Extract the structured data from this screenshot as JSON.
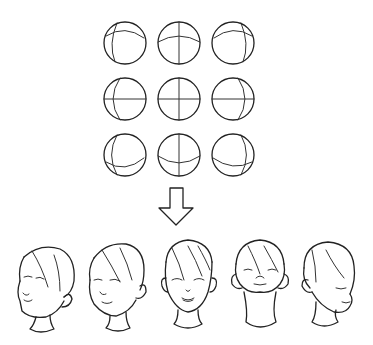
{
  "figure": {
    "description": "Head rotation guide: 3x3 grid of construction spheres mapped to drawn heads",
    "stroke_color": "#222222",
    "background": "#ffffff"
  },
  "spheres": [
    {
      "id": "up-left",
      "cx": 125,
      "cy": 43
    },
    {
      "id": "up",
      "cx": 179,
      "cy": 43
    },
    {
      "id": "up-right",
      "cx": 233,
      "cy": 43
    },
    {
      "id": "left",
      "cx": 125,
      "cy": 99
    },
    {
      "id": "front",
      "cx": 179,
      "cy": 99
    },
    {
      "id": "right",
      "cx": 233,
      "cy": 99
    },
    {
      "id": "down-left",
      "cx": 125,
      "cy": 155
    },
    {
      "id": "down",
      "cx": 179,
      "cy": 155
    },
    {
      "id": "down-right",
      "cx": 233,
      "cy": 155
    }
  ],
  "arrow": {
    "direction": "down",
    "x": 176,
    "y": 200
  },
  "heads": [
    {
      "id": "head-left-tilt",
      "view": "three-quarter left, tilted"
    },
    {
      "id": "head-three-quarter",
      "view": "three-quarter left"
    },
    {
      "id": "head-front",
      "view": "front"
    },
    {
      "id": "head-up",
      "view": "looking up"
    },
    {
      "id": "head-down-right",
      "view": "looking down right"
    }
  ]
}
